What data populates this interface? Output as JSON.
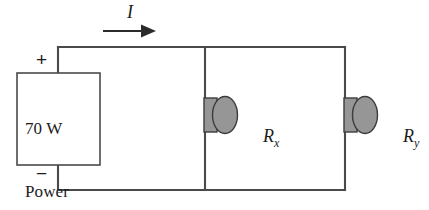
{
  "diagram": {
    "source": {
      "label_line1": "70 W",
      "label_line2": "Power",
      "label_line3": "Supply",
      "terminal_positive": "+",
      "terminal_negative": "−"
    },
    "current": {
      "symbol": "I",
      "direction": "right"
    },
    "resistors": [
      {
        "symbol": "R",
        "subscript": "x",
        "branch": "middle"
      },
      {
        "symbol": "R",
        "subscript": "y",
        "branch": "right"
      }
    ],
    "colors": {
      "wire": "#4a4a4a",
      "resistor_fill": "#969696",
      "resistor_stroke": "#3c3c3c",
      "arrow": "#2b2b2b",
      "text": "#1c1c1c",
      "background": "#ffffff"
    }
  }
}
